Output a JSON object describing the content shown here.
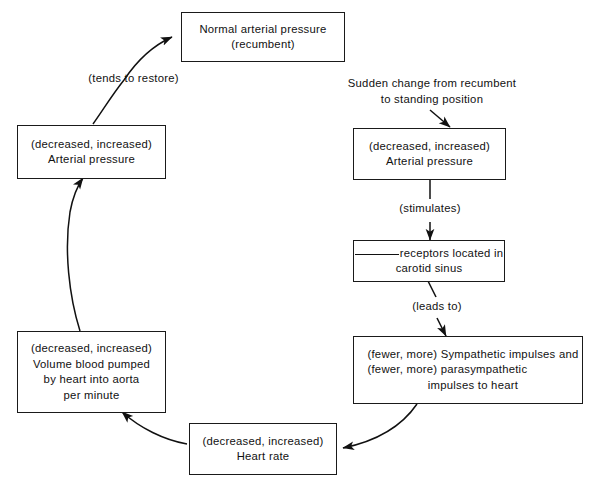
{
  "diagram": {
    "type": "flowchart",
    "nodes": [
      {
        "id": "normal-arterial-pressure",
        "lines": [
          "Normal arterial pressure",
          "(recumbent)"
        ]
      },
      {
        "id": "left-arterial-pressure",
        "lines": [
          "(decreased, increased)",
          "Arterial pressure"
        ]
      },
      {
        "id": "volume-blood-pumped",
        "lines": [
          "(decreased, increased)",
          "Volume blood pumped",
          "by heart into aorta",
          "per minute"
        ]
      },
      {
        "id": "heart-rate",
        "lines": [
          "(decreased, increased)",
          "Heart rate"
        ]
      },
      {
        "id": "right-arterial-pressure",
        "lines": [
          "(decreased, increased)",
          "Arterial pressure"
        ]
      },
      {
        "id": "receptors-carotid-sinus",
        "blank_prefix": true,
        "lines": [
          "receptors located in",
          "carotid sinus"
        ]
      },
      {
        "id": "sympathetic-impulses",
        "lines": [
          "(fewer, more) Sympathetic impulses and",
          "(fewer, more) parasympathetic",
          "impulses to heart"
        ]
      }
    ],
    "edge_labels": [
      {
        "id": "tends-to-restore",
        "lines": [
          "(tends to restore)"
        ]
      },
      {
        "id": "sudden-change",
        "lines": [
          "Sudden change from recumbent",
          "to standing position"
        ]
      },
      {
        "id": "stimulates",
        "lines": [
          "(stimulates)"
        ]
      },
      {
        "id": "leads-to",
        "lines": [
          "(leads to)"
        ]
      }
    ],
    "colors": {
      "ink": "#111111",
      "border": "#1a1a1a",
      "background": "#ffffff"
    }
  }
}
